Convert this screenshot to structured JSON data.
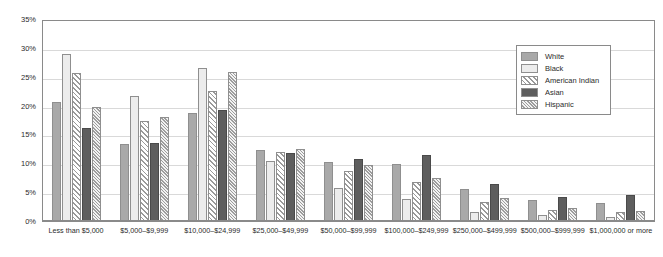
{
  "chart_data": {
    "type": "bar",
    "title": "",
    "xlabel": "",
    "ylabel": "",
    "ylim": [
      0,
      35
    ],
    "ytick_values": [
      0,
      5,
      10,
      15,
      20,
      25,
      30,
      35
    ],
    "ytick_labels": [
      "0%",
      "5%",
      "10%",
      "15%",
      "20%",
      "25%",
      "30%",
      "35%"
    ],
    "grid": true,
    "legend_position": "upper-right",
    "categories": [
      "Less than $5,000",
      "$5,000–$9,999",
      "$10,000–$24,999",
      "$25,000–$49,999",
      "$50,000–$99,999",
      "$100,000–$249,999",
      "$250,000–$499,999",
      "$500,000–$999,999",
      "$1,000,000 or more"
    ],
    "series": [
      {
        "name": "White",
        "fill": "solid",
        "color": "#a9a9a9",
        "values": [
          20.7,
          13.4,
          18.7,
          12.3,
          10.2,
          9.8,
          5.5,
          3.6,
          3.2
        ]
      },
      {
        "name": "Black",
        "fill": "solid",
        "color": "#ececec",
        "values": [
          29.0,
          21.6,
          26.5,
          10.4,
          5.7,
          3.9,
          1.6,
          1.0,
          0.7
        ]
      },
      {
        "name": "American Indian",
        "fill": "diagonal-hatch",
        "color": "#ffffff",
        "values": [
          25.7,
          17.3,
          22.6,
          12.0,
          8.6,
          6.7,
          3.3,
          1.9,
          1.5
        ]
      },
      {
        "name": "Asian",
        "fill": "solid",
        "color": "#5e5e5e",
        "values": [
          16.2,
          13.5,
          19.3,
          11.8,
          10.8,
          11.5,
          6.5,
          4.2,
          4.5
        ]
      },
      {
        "name": "Hispanic",
        "fill": "dense-diagonal-hatch",
        "color": "#f2f2f2",
        "values": [
          19.8,
          18.1,
          25.8,
          12.4,
          9.7,
          7.5,
          4.0,
          2.3,
          1.8
        ]
      }
    ]
  },
  "legend": {
    "items": [
      {
        "label": "White"
      },
      {
        "label": "Black"
      },
      {
        "label": "American Indian"
      },
      {
        "label": "Asian"
      },
      {
        "label": "Hispanic"
      }
    ]
  }
}
